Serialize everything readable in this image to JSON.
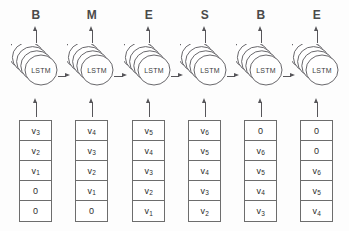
{
  "diagram": {
    "cell_label": "LSTM",
    "stacked_layers": 5,
    "colors": {
      "stroke": "#57565a",
      "box_border": "#6d6d6d",
      "text": "#2e2e2e",
      "label_text": "#4a4a4a",
      "background": "#fdfdfd"
    },
    "columns": [
      {
        "tag": "B",
        "cell": "LSTM",
        "inputs": [
          "v3",
          "v2",
          "v1",
          "0",
          "0"
        ],
        "inputs_display": [
          {
            "base": "v",
            "sub": "3"
          },
          {
            "base": "v",
            "sub": "2"
          },
          {
            "base": "v",
            "sub": "1"
          },
          {
            "base": "0",
            "sub": ""
          },
          {
            "base": "0",
            "sub": ""
          }
        ]
      },
      {
        "tag": "M",
        "cell": "LSTM",
        "inputs": [
          "v4",
          "v3",
          "v2",
          "v1",
          "0"
        ],
        "inputs_display": [
          {
            "base": "v",
            "sub": "4"
          },
          {
            "base": "v",
            "sub": "3"
          },
          {
            "base": "v",
            "sub": "2"
          },
          {
            "base": "v",
            "sub": "1"
          },
          {
            "base": "0",
            "sub": ""
          }
        ]
      },
      {
        "tag": "E",
        "cell": "LSTM",
        "inputs": [
          "v5",
          "v4",
          "v3",
          "v2",
          "v1"
        ],
        "inputs_display": [
          {
            "base": "v",
            "sub": "5"
          },
          {
            "base": "v",
            "sub": "4"
          },
          {
            "base": "v",
            "sub": "3"
          },
          {
            "base": "v",
            "sub": "2"
          },
          {
            "base": "v",
            "sub": "1"
          }
        ]
      },
      {
        "tag": "S",
        "cell": "LSTM",
        "inputs": [
          "v6",
          "v5",
          "v4",
          "v3",
          "v2"
        ],
        "inputs_display": [
          {
            "base": "v",
            "sub": "6"
          },
          {
            "base": "v",
            "sub": "5"
          },
          {
            "base": "v",
            "sub": "4"
          },
          {
            "base": "v",
            "sub": "3"
          },
          {
            "base": "v",
            "sub": "2"
          }
        ]
      },
      {
        "tag": "B",
        "cell": "LSTM",
        "inputs": [
          "0",
          "v6",
          "v5",
          "v4",
          "v3"
        ],
        "inputs_display": [
          {
            "base": "0",
            "sub": ""
          },
          {
            "base": "v",
            "sub": "6"
          },
          {
            "base": "v",
            "sub": "5"
          },
          {
            "base": "v",
            "sub": "4"
          },
          {
            "base": "v",
            "sub": "3"
          }
        ]
      },
      {
        "tag": "E",
        "cell": "LSTM",
        "inputs": [
          "0",
          "0",
          "v6",
          "v5",
          "v4"
        ],
        "inputs_display": [
          {
            "base": "0",
            "sub": ""
          },
          {
            "base": "0",
            "sub": ""
          },
          {
            "base": "v",
            "sub": "6"
          },
          {
            "base": "v",
            "sub": "5"
          },
          {
            "base": "v",
            "sub": "4"
          }
        ]
      }
    ]
  }
}
